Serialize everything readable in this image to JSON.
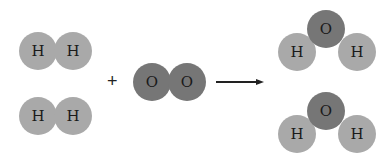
{
  "diagram": {
    "title": "",
    "reactants": {
      "h2_molecules": [
        {
          "atoms": [
            {
              "symbol": "H",
              "x": 38,
              "y": 51
            },
            {
              "symbol": "H",
              "x": 73,
              "y": 51
            }
          ]
        },
        {
          "atoms": [
            {
              "symbol": "H",
              "x": 38,
              "y": 116
            },
            {
              "symbol": "H",
              "x": 73,
              "y": 116
            }
          ]
        }
      ],
      "plus_sign": "+",
      "o2_molecule": {
        "atoms": [
          {
            "symbol": "O",
            "x": 152,
            "y": 82
          },
          {
            "symbol": "O",
            "x": 187,
            "y": 82
          }
        ]
      }
    },
    "arrow": {
      "x1": 216,
      "x2": 264,
      "y": 82
    },
    "products": {
      "h2o_molecules": [
        {
          "atoms": [
            {
              "symbol": "O",
              "x": 326,
              "y": 29
            },
            {
              "symbol": "H",
              "x": 297,
              "y": 52
            },
            {
              "symbol": "H",
              "x": 357,
              "y": 52
            }
          ]
        },
        {
          "atoms": [
            {
              "symbol": "O",
              "x": 326,
              "y": 111
            },
            {
              "symbol": "H",
              "x": 297,
              "y": 134
            },
            {
              "symbol": "H",
              "x": 357,
              "y": 134
            }
          ]
        }
      ]
    },
    "colors": {
      "hydrogen": "#a9a9a9",
      "oxygen": "#767676",
      "text": "#1a1a1a",
      "background": "#ffffff"
    },
    "equation_summary": "2 H2 + O2 → 2 H2O"
  }
}
